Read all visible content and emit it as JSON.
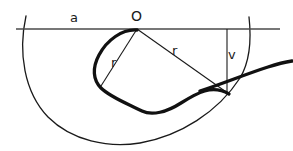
{
  "figure": {
    "kind": "geometry-diagram",
    "background_color": "#ffffff",
    "ink_color": "#1a1a1a",
    "line_color": "#3a3a3a",
    "labels": [
      {
        "id": "a",
        "text": "a",
        "x": 75,
        "y": 17,
        "role": "segment-label-horizontal-line"
      },
      {
        "id": "O",
        "text": "O",
        "x": 137,
        "y": 16,
        "role": "point-label-center"
      },
      {
        "id": "r1",
        "text": "r",
        "x": 116,
        "y": 62,
        "role": "radius-label-left"
      },
      {
        "id": "r2",
        "text": "r",
        "x": 177,
        "y": 50,
        "role": "radius-label-right"
      },
      {
        "id": "v",
        "text": "v",
        "x": 232,
        "y": 54,
        "role": "velocity-label"
      }
    ],
    "geometry": {
      "baseline": {
        "x1": 16,
        "y1": 29,
        "x2": 280,
        "y2": 29,
        "stroke_width": 1.4
      },
      "center_point": {
        "x": 137,
        "y": 29
      },
      "radius_left_line": {
        "x1": 137,
        "y1": 29,
        "x2": 101,
        "y2": 86,
        "stroke_width": 1.1
      },
      "radius_right_line": {
        "x1": 137,
        "y1": 29,
        "x2": 228,
        "y2": 93,
        "stroke_width": 1.1
      },
      "velocity_line": {
        "x1": 227,
        "y1": 29,
        "x2": 227,
        "y2": 93,
        "stroke_width": 1.1
      },
      "big_arc": {
        "center_x": 134,
        "center_y": 27,
        "radius": 116,
        "stroke_width": 1.3
      },
      "loop_curve_stroke_width": 3.2,
      "tail_curve_stroke_width": 3.2
    }
  }
}
